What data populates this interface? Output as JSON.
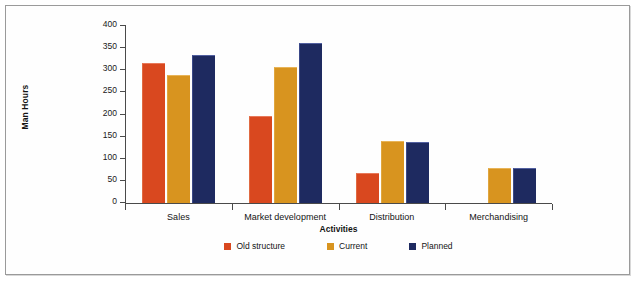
{
  "chart_data": {
    "type": "bar",
    "title": "",
    "xlabel": "Activities",
    "ylabel": "Man Hours",
    "ylim": [
      0,
      400
    ],
    "yticks": [
      0,
      50,
      100,
      150,
      200,
      250,
      300,
      350,
      400
    ],
    "grid": false,
    "legend_position": "bottom-center",
    "categories": [
      "Sales",
      "Market development",
      "Distribution",
      "Merchandising"
    ],
    "series": [
      {
        "name": "Old structure",
        "color": "#d9481f",
        "values": [
          315,
          195,
          66,
          null
        ]
      },
      {
        "name": "Current",
        "color": "#d8941f",
        "values": [
          288,
          305,
          138,
          77
        ]
      },
      {
        "name": "Planned",
        "color": "#1e2a60",
        "values": [
          332,
          360,
          135,
          77
        ]
      }
    ]
  },
  "figure": {
    "border_color": "#9a9a9a",
    "background": "#fefefe"
  }
}
